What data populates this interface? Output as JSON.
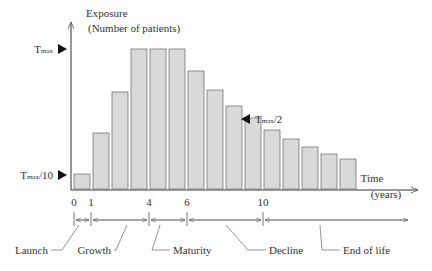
{
  "chart_data": {
    "type": "bar",
    "title": "",
    "ylabel": "Exposure (Number of patients)",
    "xlabel": "Time (years)",
    "ylabel_line1": "Exposure",
    "ylabel_line2": "(Number of patients)",
    "xlabel_line1": "Time",
    "xlabel_line2": "(years)",
    "unit": "percent of Tmax",
    "categories": [
      "0",
      "1",
      "2",
      "3",
      "4",
      "5",
      "6",
      "7",
      "8",
      "9",
      "10",
      "11",
      "12",
      "13",
      "14"
    ],
    "values": [
      10.7,
      40,
      69.3,
      100,
      100,
      100,
      84.3,
      70.7,
      59.3,
      50.7,
      42.1,
      35.7,
      30,
      25,
      21.4
    ],
    "ylim": [
      0,
      100
    ],
    "grid": false,
    "x_ticks": [
      {
        "label": "0",
        "x": 74
      },
      {
        "label": "1",
        "x": 91
      },
      {
        "label": "4",
        "x": 149
      },
      {
        "label": "6",
        "x": 187
      },
      {
        "label": "10",
        "x": 263
      }
    ],
    "y_markers": [
      {
        "label": "Tmax",
        "main": "T",
        "sub": "max",
        "suffix": "",
        "value": 100
      },
      {
        "label": "Tmax/10",
        "main": "T",
        "sub": "max",
        "suffix": "/10",
        "value": 10
      },
      {
        "label": "Tmax/2",
        "main": "T",
        "sub": "max",
        "suffix": "/2",
        "value": 50
      }
    ],
    "phases": [
      {
        "name": "Launch",
        "from": 0,
        "to": 1
      },
      {
        "name": "Growth",
        "from": 1,
        "to": 4
      },
      {
        "name": "Maturity",
        "from": 4,
        "to": 6
      },
      {
        "name": "Decline",
        "from": 6,
        "to": 10
      },
      {
        "name": "End of life",
        "from": 10,
        "to": null
      }
    ],
    "colors": {
      "bar_fill": "#d9d9d9",
      "bar_stroke": "#777777",
      "axis": "#333333"
    }
  }
}
